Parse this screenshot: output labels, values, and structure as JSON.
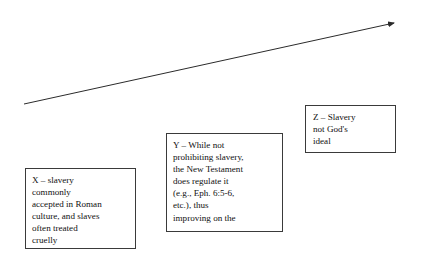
{
  "diagram": {
    "background_color": "#ffffff",
    "line_color": "#2b2b2b",
    "box_border_color": "#3a3a3a",
    "text_color": "#101010",
    "arrow": {
      "name": "progression-arrow",
      "start_x": 24,
      "start_y": 104,
      "end_x": 398,
      "end_y": 22,
      "stroke_width": 1,
      "arrowhead": "filled-triangle"
    },
    "boxes": [
      {
        "id": "x",
        "label": "X – slavery commonly accepted in Roman culture, and slaves often treated cruelly",
        "text": "X – slavery\ncommonly\naccepted in Roman\nculture, and slaves\noften treated\ncruelly",
        "x": 25,
        "y": 168,
        "width": 111,
        "height": 81,
        "text_clipped": true
      },
      {
        "id": "y",
        "label": "Y – While not prohibiting slavery, the New Testament does regulate it (e.g., Eph. 6:5-6, etc.), thus improving on the",
        "text": "Y – While not\nprohibiting slavery,\nthe New Testament\ndoes regulate it\n(e.g., Eph. 6:5-6,\netc.), thus\nimproving on the",
        "x": 166,
        "y": 133,
        "width": 117,
        "height": 99,
        "text_clipped": true
      },
      {
        "id": "z",
        "label": "Z – Slavery not God's ideal",
        "text": "Z – Slavery\nnot  God's\nideal",
        "x": 305,
        "y": 105,
        "width": 91,
        "height": 48,
        "text_clipped": false
      }
    ]
  }
}
